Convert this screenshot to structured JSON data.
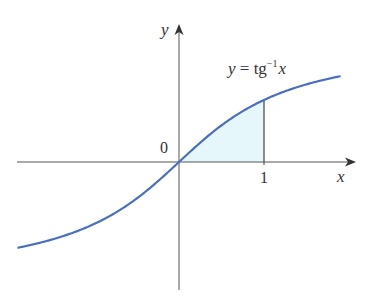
{
  "chart_data": {
    "type": "line",
    "title": "",
    "function_label": "y = tg⁻¹x",
    "xlabel": "x",
    "ylabel": "y",
    "origin_label": "0",
    "tick_labels": [
      "1"
    ],
    "x_range": [
      -1.9,
      1.9
    ],
    "series": [
      {
        "name": "y = arctan x",
        "color": "#4a6fc0"
      }
    ],
    "shaded_region": {
      "from": 0,
      "to": 1,
      "color": "#e6f7fb"
    },
    "grid": false
  },
  "labels": {
    "y_axis": "y",
    "x_axis": "x",
    "origin": "0",
    "tick_one": "1",
    "eq_y": "y",
    "eq_eq": " = tg",
    "eq_sup": "−1",
    "eq_x": "x"
  },
  "colors": {
    "curve": "#4a6fc0",
    "axis": "#555555",
    "fill": "#e6f7fb"
  }
}
